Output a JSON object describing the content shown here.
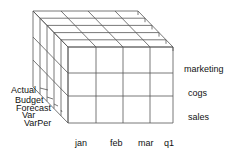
{
  "diagram": {
    "type": "olap-cube",
    "columns": [
      "jan",
      "feb",
      "mar",
      "q1"
    ],
    "rows": [
      "marketing",
      "cogs",
      "sales"
    ],
    "layers": [
      "Actual",
      "Budget",
      "Forecast",
      "Var",
      "VarPer"
    ],
    "line_color": "#555555",
    "text_color": "#111111"
  }
}
